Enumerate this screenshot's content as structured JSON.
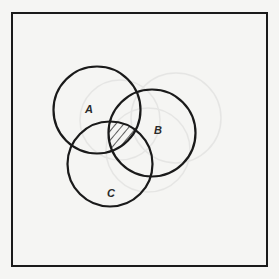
{
  "diagram": {
    "type": "venn",
    "frame": {
      "x": 12,
      "y": 13,
      "width": 255,
      "height": 253,
      "stroke": "#1a1a1a",
      "stroke_width": 2
    },
    "background": "#f5f5f3",
    "sets": [
      {
        "id": "A",
        "label": "A",
        "cx": 97,
        "cy": 110,
        "r": 43.5,
        "label_x": 89,
        "label_y": 113
      },
      {
        "id": "B",
        "label": "B",
        "cx": 152,
        "cy": 133,
        "r": 43.5,
        "label_x": 158,
        "label_y": 134
      },
      {
        "id": "C",
        "label": "C",
        "cx": 110,
        "cy": 164,
        "r": 42.5,
        "label_x": 111,
        "label_y": 197
      }
    ],
    "shaded_region": {
      "description": "A ∩ B ∩ C",
      "pattern": "diagonal-hatch",
      "stroke": "#1a1a1a"
    },
    "circle_stroke": "#1a1a1a",
    "circle_stroke_width": 2.2
  },
  "labels": {
    "A": "A",
    "B": "B",
    "C": "C"
  }
}
